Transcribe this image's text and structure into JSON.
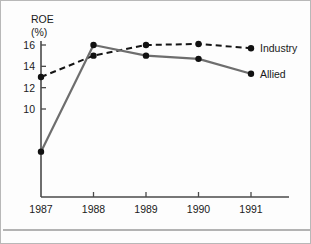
{
  "chart_data": {
    "type": "line",
    "title": "",
    "xlabel": "",
    "ylabel": "ROE",
    "ylabel_unit": "(%)",
    "categories": [
      "1987",
      "1988",
      "1989",
      "1990",
      "1991"
    ],
    "x": [
      1987,
      1988,
      1989,
      1990,
      1991
    ],
    "ylim": [
      5.0,
      16.8
    ],
    "xlim": [
      1986.6,
      1991.6
    ],
    "yticks": [
      10,
      12,
      14,
      16
    ],
    "ytick_labels": [
      "10",
      "12",
      "14",
      "16"
    ],
    "xtick_labels": [
      "1987",
      "1988",
      "1989",
      "1990",
      "1991"
    ],
    "grid": false,
    "legend_position": "right-inline",
    "series": [
      {
        "name": "Industry",
        "style": "dashed",
        "color": "#151515",
        "values": [
          13.0,
          15.0,
          16.0,
          16.1,
          15.7
        ]
      },
      {
        "name": "Allied",
        "style": "solid",
        "color": "#6e6e6e",
        "values": [
          6.0,
          16.0,
          15.0,
          14.7,
          13.3
        ]
      }
    ]
  },
  "axes": {
    "y_title_line1": "ROE",
    "y_title_line2": "(%)"
  },
  "legend": {
    "industry_label": "Industry",
    "allied_label": "Allied"
  }
}
